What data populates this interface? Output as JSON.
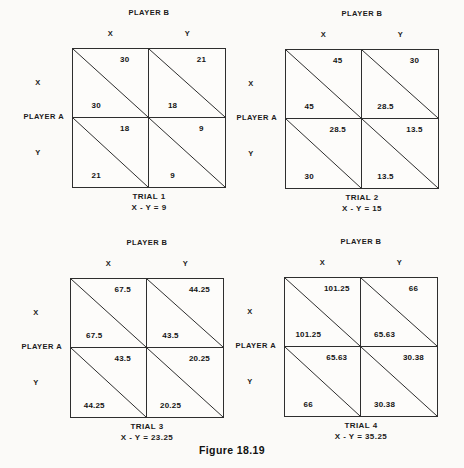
{
  "figure_caption": "Figure 18.19",
  "labels": {
    "player_a": "PLAYER A",
    "player_b": "PLAYER B",
    "x": "X",
    "y": "Y"
  },
  "matrices": [
    {
      "trial": "TRIAL 1",
      "equation": "X - Y = 9",
      "cells": {
        "xx": {
          "top": "30",
          "bottom": "30"
        },
        "xy": {
          "top": "21",
          "bottom": "18"
        },
        "yx": {
          "top": "18",
          "bottom": "21"
        },
        "yy": {
          "top": "9",
          "bottom": "9"
        }
      }
    },
    {
      "trial": "TRIAL 2",
      "equation": "X - Y = 15",
      "cells": {
        "xx": {
          "top": "45",
          "bottom": "45"
        },
        "xy": {
          "top": "30",
          "bottom": "28.5"
        },
        "yx": {
          "top": "28.5",
          "bottom": "30"
        },
        "yy": {
          "top": "13.5",
          "bottom": "13.5"
        }
      }
    },
    {
      "trial": "TRIAL 3",
      "equation": "X - Y = 23.25",
      "cells": {
        "xx": {
          "top": "67.5",
          "bottom": "67.5"
        },
        "xy": {
          "top": "44.25",
          "bottom": "43.5"
        },
        "yx": {
          "top": "43.5",
          "bottom": "44.25"
        },
        "yy": {
          "top": "20.25",
          "bottom": "20.25"
        }
      }
    },
    {
      "trial": "TRIAL 4",
      "equation": "X - Y = 35.25",
      "cells": {
        "xx": {
          "top": "101.25",
          "bottom": "101.25"
        },
        "xy": {
          "top": "66",
          "bottom": "65.63"
        },
        "yx": {
          "top": "65.63",
          "bottom": "66"
        },
        "yy": {
          "top": "30.38",
          "bottom": "30.38"
        }
      }
    }
  ]
}
